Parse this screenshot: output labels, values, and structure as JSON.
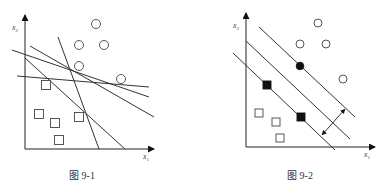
{
  "figures": [
    {
      "caption": "图 9-1",
      "x_axis_label": "x",
      "x_axis_sub": "1",
      "y_axis_label": "x",
      "y_axis_sub": "2",
      "description": "Many separating lines between circles and squares",
      "circles": [
        [
          96,
          24
        ],
        [
          79,
          45
        ],
        [
          104,
          45
        ],
        [
          79,
          66
        ],
        [
          121,
          79
        ]
      ],
      "squares": [
        [
          46,
          85
        ],
        [
          39,
          114
        ],
        [
          55,
          123
        ],
        [
          79,
          117
        ],
        [
          59,
          140
        ]
      ],
      "lines": [
        [
          12,
          50,
          149,
          97
        ],
        [
          30,
          46,
          154,
          117
        ],
        [
          17,
          76,
          149,
          87
        ],
        [
          58,
          37,
          99,
          149
        ],
        [
          25,
          58,
          125,
          149
        ]
      ]
    },
    {
      "caption": "图 9-2",
      "x_axis_label": "x",
      "x_axis_sub": "1",
      "y_axis_label": "x",
      "y_axis_sub": "2",
      "description": "Maximum-margin hyperplane with support vectors",
      "circles": [
        [
          318,
          23
        ],
        [
          300,
          44
        ],
        [
          326,
          44
        ],
        [
          343,
          79
        ]
      ],
      "support_circles": [
        [
          300,
          66
        ]
      ],
      "squares": [
        [
          259,
          113
        ],
        [
          276,
          122
        ],
        [
          280,
          138
        ]
      ],
      "support_squares": [
        [
          267,
          85
        ],
        [
          301,
          117
        ]
      ],
      "lines": [
        [
          259,
          27,
          355,
          117
        ],
        [
          246,
          41,
          350,
          139
        ],
        [
          233,
          53,
          335,
          150
        ]
      ],
      "margin_arrow": [
        322,
        135,
        345,
        109
      ]
    }
  ]
}
